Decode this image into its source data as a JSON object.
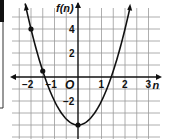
{
  "chart_data": {
    "type": "line",
    "title": "",
    "function": "f(n) = 2n^2 - 4",
    "xlabel": "n",
    "ylabel": "f(n)",
    "origin_label": "O",
    "x_ticks": [
      -2,
      -1,
      1,
      2,
      3
    ],
    "y_ticks": [
      4,
      2,
      -2
    ],
    "x_tick_labels": [
      "−2",
      "−1",
      "1",
      "2",
      "3"
    ],
    "y_tick_labels": [
      "4",
      "2",
      "−2"
    ],
    "xlim": [
      -3.2,
      3.5
    ],
    "ylim": [
      -5.2,
      6.3
    ],
    "grid": true,
    "grid_step_x": 0.5,
    "grid_step_y": 1,
    "points": [
      {
        "x": -2,
        "y": 4
      },
      {
        "x": -1.5,
        "y": 0.5
      },
      {
        "x": 0,
        "y": -4
      }
    ],
    "series": [
      {
        "name": "f(n)",
        "x": [
          -2.2,
          -2,
          -1.5,
          -1,
          -0.5,
          0,
          0.5,
          1,
          1.5,
          2,
          2.2
        ],
        "values": [
          5.68,
          4,
          0.5,
          -2,
          -3.5,
          -4,
          -3.5,
          -2,
          0.5,
          4,
          5.68
        ]
      }
    ],
    "colors": {
      "curve": "#111111",
      "grid": "#9a9a9a",
      "axis": "#111111"
    }
  }
}
